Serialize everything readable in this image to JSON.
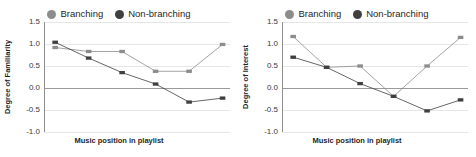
{
  "figure": {
    "panels": [
      {
        "id": "familiarity",
        "legend": [
          {
            "label": "Branching",
            "color": "#8c8c8c",
            "marker": "legend-dot-branching"
          },
          {
            "label": "Non-branching",
            "color": "#3f3f3f",
            "marker": "legend-dot-non-branching"
          }
        ],
        "chart_data": {
          "type": "line",
          "title": "",
          "xlabel": "Music position in playlist",
          "ylabel": "Degree of Familiarity",
          "x": [
            1,
            2,
            3,
            4,
            5,
            6
          ],
          "categories": [
            "1",
            "2",
            "3",
            "4",
            "5",
            "6"
          ],
          "ylim": [
            -1.0,
            1.5
          ],
          "yticks": [
            1.5,
            1.0,
            0.5,
            0.0,
            -0.5,
            -1.0
          ],
          "yticklabels": [
            "1.5",
            "1.0",
            "0.5",
            "0.0",
            "-0.5",
            "-1.0"
          ],
          "xticklabels": [],
          "grid": true,
          "legend_position": "top-center",
          "series": [
            {
              "name": "Branching",
              "color": "#8c8c8c",
              "values": [
                0.92,
                0.83,
                0.83,
                0.38,
                0.38,
                0.99
              ]
            },
            {
              "name": "Non-branching",
              "color": "#3f3f3f",
              "values": [
                1.04,
                0.68,
                0.35,
                0.09,
                -0.32,
                -0.23
              ]
            }
          ]
        }
      },
      {
        "id": "interest",
        "legend": [
          {
            "label": "Branching",
            "color": "#8c8c8c",
            "marker": "legend-dot-branching"
          },
          {
            "label": "Non-branching",
            "color": "#3f3f3f",
            "marker": "legend-dot-non-branching"
          }
        ],
        "chart_data": {
          "type": "line",
          "title": "",
          "xlabel": "Music position in playlist",
          "ylabel": "Degree of Interest",
          "x": [
            1,
            2,
            3,
            4,
            5,
            6
          ],
          "categories": [
            "1",
            "2",
            "3",
            "4",
            "5",
            "6"
          ],
          "ylim": [
            -1.0,
            1.5
          ],
          "yticks": [
            1.5,
            1.0,
            0.5,
            0.0,
            -0.5,
            -1.0
          ],
          "yticklabels": [
            "1.5",
            "1.0",
            "0.5",
            "0.0",
            "-0.5",
            "-1.0"
          ],
          "xticklabels": [],
          "grid": true,
          "legend_position": "top-center",
          "series": [
            {
              "name": "Branching",
              "color": "#8c8c8c",
              "values": [
                1.17,
                0.47,
                0.5,
                -0.19,
                0.5,
                1.15
              ]
            },
            {
              "name": "Non-branching",
              "color": "#3f3f3f",
              "values": [
                0.7,
                0.47,
                0.1,
                -0.19,
                -0.52,
                -0.27
              ]
            }
          ]
        }
      }
    ]
  }
}
